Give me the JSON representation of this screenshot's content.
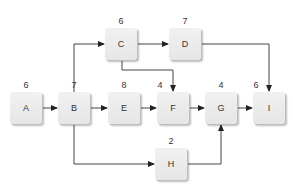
{
  "diagram": {
    "type": "activity-network",
    "nodes": [
      {
        "id": "A",
        "label": "A",
        "duration": "6",
        "x": 10,
        "y": 92
      },
      {
        "id": "B",
        "label": "B",
        "duration": "7",
        "x": 58,
        "y": 92
      },
      {
        "id": "C",
        "label": "C",
        "duration": "6",
        "x": 105,
        "y": 28
      },
      {
        "id": "D",
        "label": "D",
        "duration": "7",
        "x": 169,
        "y": 28
      },
      {
        "id": "E",
        "label": "E",
        "duration": "8",
        "x": 108,
        "y": 92
      },
      {
        "id": "F",
        "label": "F",
        "duration": "4",
        "x": 157,
        "y": 92
      },
      {
        "id": "G",
        "label": "G",
        "duration": "4",
        "x": 205,
        "y": 92
      },
      {
        "id": "H",
        "label": "H",
        "duration": "2",
        "x": 155,
        "y": 148
      },
      {
        "id": "I",
        "label": "I",
        "duration": "6",
        "x": 253,
        "y": 92
      }
    ],
    "edges": [
      {
        "from": "A",
        "to": "B"
      },
      {
        "from": "B",
        "to": "C"
      },
      {
        "from": "B",
        "to": "E"
      },
      {
        "from": "B",
        "to": "H"
      },
      {
        "from": "C",
        "to": "D"
      },
      {
        "from": "C",
        "to": "F"
      },
      {
        "from": "D",
        "to": "I"
      },
      {
        "from": "E",
        "to": "F"
      },
      {
        "from": "F",
        "to": "G"
      },
      {
        "from": "G",
        "to": "I"
      },
      {
        "from": "H",
        "to": "G"
      }
    ]
  },
  "colors": {
    "edge": "#333333",
    "node_fill": "#ececec",
    "text": "#333333"
  }
}
